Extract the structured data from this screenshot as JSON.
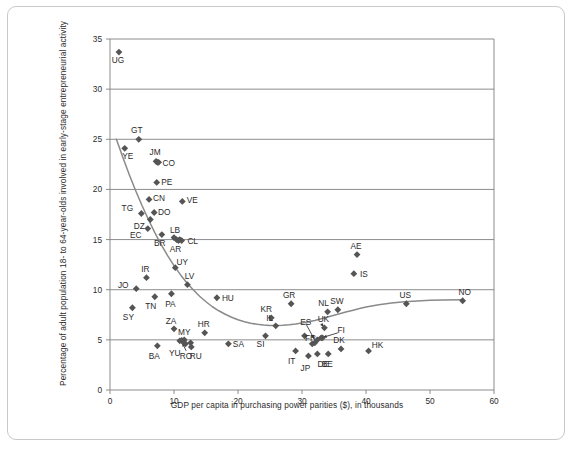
{
  "chart_data": {
    "type": "scatter",
    "title": "",
    "xlabel": "GDP per capita in purchasing power parities ($), in thousands",
    "ylabel": "Percentage of adult population 18- to 64-year-olds involved in early-stage entrepreneurial activity",
    "xlim": [
      0,
      60
    ],
    "ylim": [
      0,
      35
    ],
    "xticks": [
      0,
      10,
      20,
      30,
      40,
      50,
      60
    ],
    "yticks": [
      0,
      5,
      10,
      15,
      20,
      25,
      30,
      35
    ],
    "grid": "horizontal",
    "legend": "none",
    "marker": "diamond",
    "marker_color": "#555555",
    "trend_line": {
      "label": "fitted U-shaped trend curve",
      "color": "#8a8a8a",
      "points": [
        [
          1.0,
          25.0
        ],
        [
          2.0,
          23.2
        ],
        [
          3.0,
          21.5
        ],
        [
          4.0,
          19.9
        ],
        [
          5.0,
          18.4
        ],
        [
          6.0,
          17.0
        ],
        [
          7.0,
          15.7
        ],
        [
          8.0,
          14.5
        ],
        [
          9.0,
          13.4
        ],
        [
          10.0,
          12.4
        ],
        [
          11.0,
          11.5
        ],
        [
          12.0,
          10.7
        ],
        [
          13.0,
          10.0
        ],
        [
          14.0,
          9.35
        ],
        [
          15.0,
          8.8
        ],
        [
          16.0,
          8.3
        ],
        [
          17.0,
          7.9
        ],
        [
          18.0,
          7.55
        ],
        [
          19.0,
          7.25
        ],
        [
          20.0,
          7.0
        ],
        [
          21.0,
          6.8
        ],
        [
          22.0,
          6.65
        ],
        [
          23.0,
          6.55
        ],
        [
          24.0,
          6.48
        ],
        [
          25.0,
          6.44
        ],
        [
          26.0,
          6.43
        ],
        [
          27.0,
          6.45
        ],
        [
          28.0,
          6.5
        ],
        [
          29.0,
          6.58
        ],
        [
          30.0,
          6.68
        ],
        [
          31.0,
          6.8
        ],
        [
          32.0,
          6.94
        ],
        [
          33.0,
          7.1
        ],
        [
          34.0,
          7.27
        ],
        [
          35.0,
          7.45
        ],
        [
          36.0,
          7.62
        ],
        [
          37.0,
          7.8
        ],
        [
          38.0,
          7.96
        ],
        [
          39.0,
          8.12
        ],
        [
          40.0,
          8.27
        ],
        [
          42.0,
          8.5
        ],
        [
          44.0,
          8.68
        ],
        [
          46.0,
          8.8
        ],
        [
          48.0,
          8.88
        ],
        [
          50.0,
          8.94
        ],
        [
          52.0,
          8.97
        ],
        [
          55.0,
          9.0
        ]
      ]
    },
    "points": [
      {
        "code": "UG",
        "x": 1.4,
        "y": 33.7,
        "label_dx": -1,
        "label_dy": 11
      },
      {
        "code": "GT",
        "x": 4.5,
        "y": 25.0,
        "label_dx": -2,
        "label_dy": -6
      },
      {
        "code": "YE",
        "x": 2.3,
        "y": 24.1,
        "label_dx": 3,
        "label_dy": 11
      },
      {
        "code": "JM",
        "x": 7.2,
        "y": 22.8,
        "label_dx": -1,
        "label_dy": -6
      },
      {
        "code": "CO",
        "x": 7.6,
        "y": 22.7,
        "label_dx": 10,
        "label_dy": 4
      },
      {
        "code": "PE",
        "x": 7.3,
        "y": 20.7,
        "label_dx": 10,
        "label_dy": 3
      },
      {
        "code": "CN",
        "x": 6.1,
        "y": 19.0,
        "label_dx": 10,
        "label_dy": 2
      },
      {
        "code": "VE",
        "x": 11.3,
        "y": 18.8,
        "label_dx": 10,
        "label_dy": 2
      },
      {
        "code": "TG",
        "x": 4.9,
        "y": 17.6,
        "label_dx": -14,
        "label_dy": -2
      },
      {
        "code": "DO",
        "x": 6.9,
        "y": 17.7,
        "label_dx": 10,
        "label_dy": 3
      },
      {
        "code": "DZ",
        "x": 6.3,
        "y": 17.0,
        "label_dx": -11,
        "label_dy": 9
      },
      {
        "code": "EC",
        "x": 5.9,
        "y": 16.1,
        "label_dx": -12,
        "label_dy": 9
      },
      {
        "code": "BR",
        "x": 8.1,
        "y": 15.5,
        "label_dx": -2,
        "label_dy": 11
      },
      {
        "code": "LB",
        "x": 10.0,
        "y": 15.2,
        "label_dx": 1,
        "label_dy": -5
      },
      {
        "code": "AR",
        "x": 10.4,
        "y": 15.0,
        "label_dx": -1,
        "label_dy": 12
      },
      {
        "code": "CL",
        "x": 11.2,
        "y": 14.9,
        "label_dx": 11,
        "label_dy": 3
      },
      {
        "code": "AE",
        "x": 38.6,
        "y": 13.5,
        "label_dx": -1,
        "label_dy": -6
      },
      {
        "code": "UY",
        "x": 10.2,
        "y": 12.2,
        "label_dx": 7,
        "label_dy": -3
      },
      {
        "code": "IS",
        "x": 38.1,
        "y": 11.6,
        "label_dx": 10,
        "label_dy": 3
      },
      {
        "code": "IR",
        "x": 5.7,
        "y": 11.2,
        "label_dx": -1,
        "label_dy": -6
      },
      {
        "code": "LV",
        "x": 12.1,
        "y": 10.5,
        "label_dx": 2,
        "label_dy": -6
      },
      {
        "code": "JO",
        "x": 4.1,
        "y": 10.1,
        "label_dx": -13,
        "label_dy": -1
      },
      {
        "code": "PA",
        "x": 9.6,
        "y": 9.6,
        "label_dx": -1,
        "label_dy": 13
      },
      {
        "code": "TN",
        "x": 7.0,
        "y": 9.3,
        "label_dx": -4,
        "label_dy": 12
      },
      {
        "code": "HU",
        "x": 16.7,
        "y": 9.2,
        "label_dx": 11,
        "label_dy": 3
      },
      {
        "code": "NO",
        "x": 55.1,
        "y": 8.9,
        "label_dx": 2,
        "label_dy": -6
      },
      {
        "code": "US",
        "x": 46.3,
        "y": 8.6,
        "label_dx": -1,
        "label_dy": -6
      },
      {
        "code": "GR",
        "x": 28.3,
        "y": 8.6,
        "label_dx": -2,
        "label_dy": -6
      },
      {
        "code": "SY",
        "x": 3.5,
        "y": 8.2,
        "label_dx": -4,
        "label_dy": 12
      },
      {
        "code": "SW",
        "x": 35.6,
        "y": 8.0,
        "label_dx": -1,
        "label_dy": -6
      },
      {
        "code": "NL",
        "x": 34.0,
        "y": 7.8,
        "label_dx": -4,
        "label_dy": -6
      },
      {
        "code": "KR",
        "x": 25.2,
        "y": 7.2,
        "label_dx": -5,
        "label_dy": -6
      },
      {
        "code": "IL",
        "x": 25.9,
        "y": 6.4,
        "label_dx": -6,
        "label_dy": -5
      },
      {
        "code": "UK",
        "x": 33.5,
        "y": 6.2,
        "label_dx": -1,
        "label_dy": -6
      },
      {
        "code": "ZA",
        "x": 10.0,
        "y": 6.1,
        "label_dx": -3,
        "label_dy": -5
      },
      {
        "code": "HR",
        "x": 14.8,
        "y": 5.7,
        "label_dx": -1,
        "label_dy": -6
      },
      {
        "code": "FR",
        "x": 30.4,
        "y": 5.4,
        "label_dx": 6,
        "label_dy": 5
      },
      {
        "code": "SI",
        "x": 24.3,
        "y": 5.4,
        "label_dx": -5,
        "label_dy": 11
      },
      {
        "code": "MY",
        "x": 11.6,
        "y": 5.0,
        "label_dx": 0,
        "label_dy": -5
      },
      {
        "code": "YU",
        "x": 10.9,
        "y": 4.9,
        "label_dx": -5,
        "label_dy": 15
      },
      {
        "code": "RO",
        "x": 11.4,
        "y": 4.8,
        "label_dx": 3,
        "label_dy": 17
      },
      {
        "code": "RU",
        "x": 12.6,
        "y": 4.7,
        "label_dx": 5,
        "label_dy": 16
      },
      {
        "code": "SA",
        "x": 18.5,
        "y": 4.6,
        "label_dx": 10,
        "label_dy": 3
      },
      {
        "code": "BA",
        "x": 7.4,
        "y": 4.4,
        "label_dx": -3,
        "label_dy": 13
      },
      {
        "code": "ES",
        "x": 32.0,
        "y": 4.7,
        "label_dx": -9,
        "label_dy": -18
      },
      {
        "code": "FI",
        "x": 33.0,
        "y": 5.2,
        "label_dx": 20,
        "label_dy": -5
      },
      {
        "code": "DK",
        "x": 36.1,
        "y": 4.1,
        "label_dx": -2,
        "label_dy": -6
      },
      {
        "code": "HK",
        "x": 40.4,
        "y": 3.9,
        "label_dx": 9,
        "label_dy": -3
      },
      {
        "code": "BE",
        "x": 34.1,
        "y": 3.6,
        "label_dx": -1,
        "label_dy": 13
      },
      {
        "code": "DE",
        "x": 32.4,
        "y": 3.6,
        "label_dx": 6,
        "label_dy": 13
      },
      {
        "code": "JP",
        "x": 31.0,
        "y": 3.4,
        "label_dx": -3,
        "label_dy": 15
      },
      {
        "code": "IT",
        "x": 29.0,
        "y": 3.9,
        "label_dx": -4,
        "label_dy": 13
      },
      {
        "code": "RU2",
        "x": 12.7,
        "y": 4.3,
        "label_dx": 0,
        "label_dy": 0,
        "hide_label": true
      },
      {
        "code": "MY2",
        "x": 11.8,
        "y": 4.6,
        "label_dx": 0,
        "label_dy": 0,
        "hide_label": true
      },
      {
        "code": "CL2",
        "x": 10.9,
        "y": 15.0,
        "label_dx": 0,
        "label_dy": 0,
        "hide_label": true
      },
      {
        "code": "AR2",
        "x": 10.7,
        "y": 14.9,
        "label_dx": 0,
        "label_dy": 0,
        "hide_label": true
      },
      {
        "code": "JM2",
        "x": 7.4,
        "y": 22.7,
        "label_dx": 0,
        "label_dy": 0,
        "hide_label": true
      },
      {
        "code": "YU2",
        "x": 11.2,
        "y": 4.95,
        "label_dx": 0,
        "label_dy": 0,
        "hide_label": true
      },
      {
        "code": "ES2",
        "x": 32.4,
        "y": 5.0,
        "label_dx": 0,
        "label_dy": 0,
        "hide_label": true
      },
      {
        "code": "UK2",
        "x": 33.2,
        "y": 5.2,
        "label_dx": 0,
        "label_dy": 0,
        "hide_label": true
      },
      {
        "code": "ES3",
        "x": 31.6,
        "y": 4.6,
        "label_dx": 0,
        "label_dy": 0,
        "hide_label": true
      }
    ],
    "annotation_arrows": [
      {
        "from_label": "ES",
        "x1": 30.6,
        "y1": 6.6,
        "x2": 31.9,
        "y2": 5.1
      },
      {
        "from_label": "UK",
        "x1": 33.0,
        "y1": 6.6,
        "x2": 33.4,
        "y2": 6.3
      },
      {
        "from_label": "FI",
        "x1": 35.6,
        "y1": 5.7,
        "x2": 33.3,
        "y2": 5.25
      },
      {
        "from_label": "RO",
        "x1": 11.9,
        "y1": 3.9,
        "x2": 11.3,
        "y2": 4.7
      }
    ]
  }
}
